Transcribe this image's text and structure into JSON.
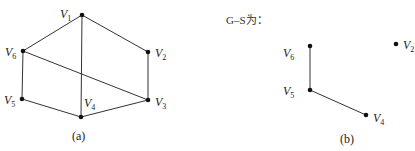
{
  "graph_a": {
    "caption": "(a)",
    "vertices": [
      {
        "id": "V1",
        "name": "V",
        "sub": "1",
        "x": 82,
        "y": 15,
        "lx": 60,
        "ly": 18
      },
      {
        "id": "V2",
        "name": "V",
        "sub": "2",
        "x": 148,
        "y": 52,
        "lx": 155,
        "ly": 57
      },
      {
        "id": "V3",
        "name": "V",
        "sub": "3",
        "x": 148,
        "y": 100,
        "lx": 155,
        "ly": 106
      },
      {
        "id": "V4",
        "name": "V",
        "sub": "4",
        "x": 81,
        "y": 117,
        "lx": 84,
        "ly": 107
      },
      {
        "id": "V5",
        "name": "V",
        "sub": "5",
        "x": 22,
        "y": 99,
        "lx": 4,
        "ly": 104
      },
      {
        "id": "V6",
        "name": "V",
        "sub": "6",
        "x": 23,
        "y": 51,
        "lx": 5,
        "ly": 56
      }
    ],
    "edges": [
      [
        "V1",
        "V6"
      ],
      [
        "V1",
        "V2"
      ],
      [
        "V1",
        "V4"
      ],
      [
        "V2",
        "V3"
      ],
      [
        "V6",
        "V5"
      ],
      [
        "V6",
        "V3"
      ],
      [
        "V5",
        "V4"
      ],
      [
        "V4",
        "V3"
      ]
    ]
  },
  "graph_b": {
    "title": "G–S为：",
    "caption": "(b)",
    "vertices": [
      {
        "id": "V6",
        "name": "V",
        "sub": "6",
        "x": 310,
        "y": 46,
        "lx": 283,
        "ly": 57
      },
      {
        "id": "V5",
        "name": "V",
        "sub": "5",
        "x": 310,
        "y": 90,
        "lx": 283,
        "ly": 95
      },
      {
        "id": "V4",
        "name": "V",
        "sub": "4",
        "x": 366,
        "y": 115,
        "lx": 373,
        "ly": 122
      },
      {
        "id": "V2",
        "name": "V",
        "sub": "2",
        "x": 396,
        "y": 44,
        "lx": 403,
        "ly": 49
      }
    ],
    "edges": [
      [
        "V6",
        "V5"
      ],
      [
        "V5",
        "V4"
      ]
    ]
  }
}
